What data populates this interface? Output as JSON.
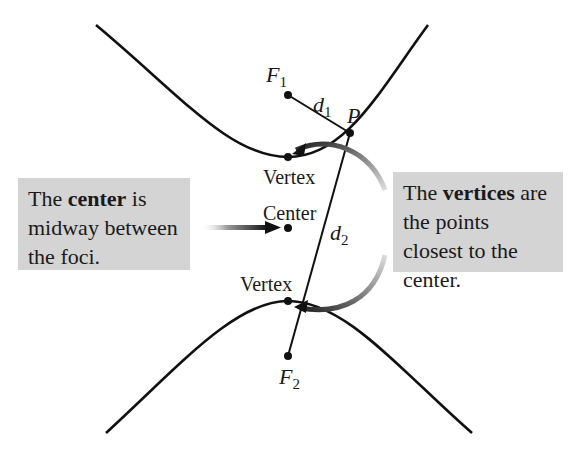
{
  "labels": {
    "focus1": "F",
    "focus1_sub": "1",
    "focus2": "F",
    "focus2_sub": "2",
    "distance1": "d",
    "distance1_sub": "1",
    "distance2": "d",
    "distance2_sub": "2",
    "point": "P",
    "vertex_top": "Vertex",
    "vertex_bottom": "Vertex",
    "center": "Center"
  },
  "callouts": {
    "left": {
      "pre": "The ",
      "bold": "center",
      "post": " is midway between the foci."
    },
    "right": {
      "pre": "The ",
      "bold": "vertices",
      "post": " are the points closest to the center."
    }
  },
  "colors": {
    "curve": "#111111",
    "box_fill": "#d4d4d4",
    "arrow_fade": "#c8c8c8"
  }
}
